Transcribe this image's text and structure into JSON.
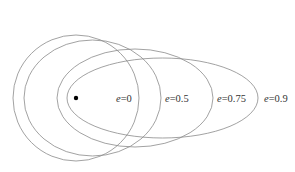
{
  "diagram": {
    "title": "",
    "focus": {
      "name": "focus-point",
      "color": "#000000"
    },
    "orbits": [
      {
        "id": "e0",
        "eccentricity_label": "e=0",
        "symbol": "e",
        "value": "0"
      },
      {
        "id": "e05",
        "eccentricity_label": "e=0.5",
        "symbol": "e",
        "value": "0.5"
      },
      {
        "id": "e075",
        "eccentricity_label": "e=0.75",
        "symbol": "e",
        "value": "0.75"
      },
      {
        "id": "e09",
        "eccentricity_label": "e=0.9",
        "symbol": "e",
        "value": "0.9"
      }
    ],
    "stroke_color": "#8a8a8a"
  }
}
